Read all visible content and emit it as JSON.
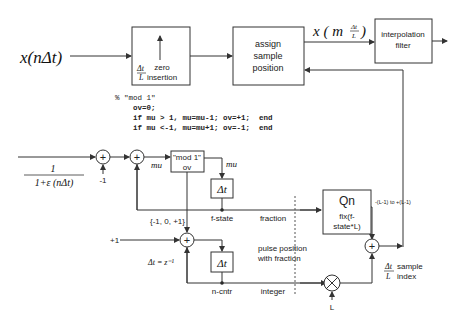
{
  "input": {
    "signal": "x(nΔt)"
  },
  "blocks": {
    "zero_insertion": {
      "label_line1": "zero",
      "label_line2": "insertion",
      "rate_num": "Δt",
      "rate_den": "L"
    },
    "assign_sample": {
      "line1": "assign",
      "line2": "sample",
      "line3": "position"
    },
    "interp_filter": {
      "line1": "interpolation",
      "line2": "filter"
    },
    "mod1": {
      "line1": "\"mod 1\"",
      "line2": "ov"
    },
    "delay_f": {
      "label": "Δt"
    },
    "delay_n": {
      "label": "Δt"
    },
    "qn": {
      "title": "Qn",
      "line1": "fix(f-",
      "line2": "state*L)",
      "range": "-(L-1) to +(L-1)"
    }
  },
  "signals": {
    "upsampled": {
      "prefix": "x ( m",
      "frac_num": "Δt",
      "frac_den": "L",
      "suffix": ")"
    },
    "inverse_num": "1",
    "inverse_den": "1+ε (nΔt)",
    "minus_one": "-1",
    "mu_1": "mu",
    "mu_2": "mu",
    "f_state": "f-state",
    "fraction": "fraction",
    "ov_set": "{-1, 0, +1}",
    "plus_one": "+1",
    "delay_eq": "Δt = z⁻¹",
    "pulse_line1": "pulse position",
    "pulse_line2": "with fraction",
    "n_cntr": "n-cntr",
    "integer": "integer",
    "L": "L",
    "index_num": "Δt",
    "index_den": "L",
    "index_line1": "sample",
    "index_line2": "index"
  },
  "code": {
    "lines": [
      "% \"mod 1\"",
      "    ov=0;",
      "    if mu > 1, mu=mu-1; ov=+1;  end",
      "    if mu <-1, mu=mu+1; ov=-1;  end"
    ]
  }
}
